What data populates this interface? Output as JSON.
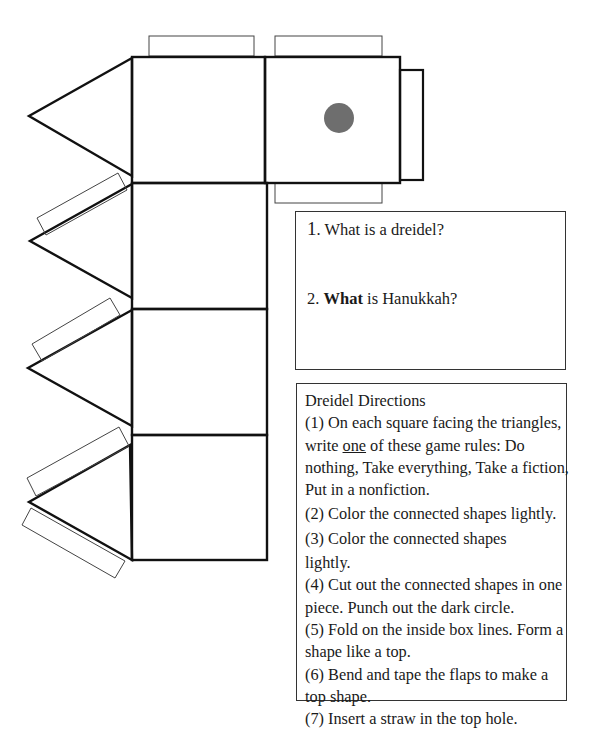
{
  "worksheet": {
    "questions": [
      {
        "number": "1",
        "text": ". What is a dreidel?"
      },
      {
        "number": "2. ",
        "bold_word": "What",
        "text": " is Hanukkah?"
      }
    ],
    "directions": {
      "title": "Dreidel Directions",
      "lines": [
        "(1) On each square facing the triangles,",
        "write ",
        "one",
        " of these game rules: Do",
        "nothing, Take everything, Take a fiction,",
        "Put in a nonfiction.",
        "(2) Color the connected shapes lightly.",
        "(3) Color the connected shapes",
        "lightly.",
        "(4) Cut out the connected shapes in one",
        "piece. Punch out the dark circle.",
        "(5) Fold on the inside box lines. Form a",
        "shape like a top.",
        "(6) Bend and tape the flaps to make a",
        "top shape.",
        "(7) Insert a straw in the top hole."
      ]
    },
    "colors": {
      "outline": "#111111",
      "flap_outline": "#333333",
      "punch_circle": "#6e6e6e"
    }
  }
}
